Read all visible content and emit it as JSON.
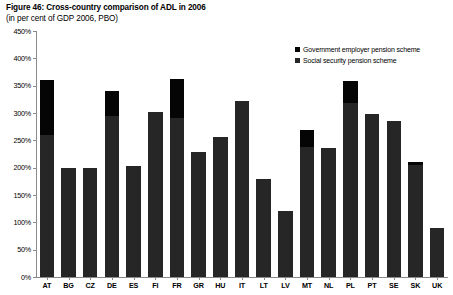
{
  "figure": {
    "title": "Figure 46: Cross-country comparison of ADL in 2006",
    "subtitle": "(in per cent of GDP 2006, PBO)"
  },
  "legend": {
    "position": "top-right",
    "items": [
      {
        "label": "Government employer pension scheme",
        "color": "#050505",
        "key": "government_employer"
      },
      {
        "label": "Social security pension scheme",
        "color": "#262626",
        "key": "social_security"
      }
    ]
  },
  "axes": {
    "y_ticks": [
      "0%",
      "50%",
      "100%",
      "150%",
      "200%",
      "250%",
      "300%",
      "350%",
      "400%",
      "450%"
    ],
    "y_min": 0,
    "y_max": 450,
    "y_step": 50,
    "x_label": "",
    "y_label": ""
  },
  "chart_data": {
    "type": "bar",
    "subtype": "stacked-vertical",
    "title": "Figure 46: Cross-country comparison of ADL in 2006",
    "subtitle": "(in per cent of GDP 2006, PBO)",
    "xlabel": "",
    "ylabel": "",
    "ylim": [
      0,
      450
    ],
    "ytick_step": 50,
    "yunit": "per cent of GDP",
    "grid": false,
    "legend_position": "top-right",
    "categories": [
      "AT",
      "BG",
      "CZ",
      "DE",
      "ES",
      "FI",
      "FR",
      "GR",
      "HU",
      "IT",
      "LT",
      "LV",
      "MT",
      "NL",
      "PL",
      "PT",
      "SE",
      "SK",
      "UK"
    ],
    "series": [
      {
        "name": "Social security pension scheme",
        "color": "#262626",
        "values": [
          260,
          200,
          200,
          295,
          203,
          302,
          290,
          228,
          256,
          322,
          180,
          120,
          238,
          236,
          318,
          298,
          285,
          205,
          90
        ]
      },
      {
        "name": "Government employer pension scheme",
        "color": "#050505",
        "values": [
          100,
          0,
          0,
          45,
          0,
          0,
          72,
          0,
          0,
          0,
          0,
          0,
          30,
          0,
          40,
          0,
          0,
          5,
          0
        ]
      }
    ],
    "totals": [
      360,
      200,
      200,
      340,
      203,
      302,
      362,
      228,
      256,
      322,
      180,
      120,
      268,
      236,
      358,
      298,
      285,
      210,
      90
    ]
  }
}
